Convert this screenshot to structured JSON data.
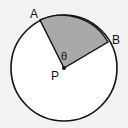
{
  "diagram": {
    "center_label": "P",
    "point_a_label": "A",
    "point_b_label": "B",
    "angle_label": "θ",
    "colors": {
      "background": "#f2f2f2",
      "circle_fill": "#ffffff",
      "sector_fill": "#a9a9a9",
      "stroke": "#111111"
    }
  }
}
